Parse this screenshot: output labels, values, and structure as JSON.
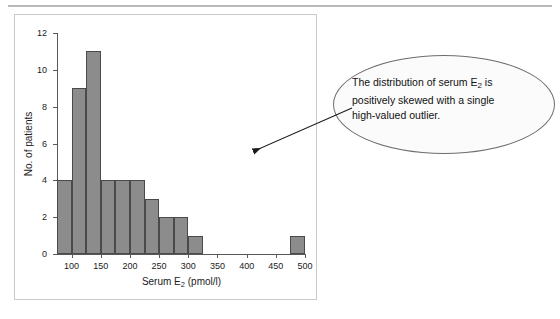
{
  "figure": {
    "annotation": {
      "line1_pre": "The distribution of serum E",
      "line1_sub": "2",
      "line1_post": " is",
      "line2": "positively skewed with a single",
      "line3": "high-valued outlier.",
      "arrow_name": "callout-arrow"
    }
  },
  "chart_data": {
    "type": "bar",
    "title": "",
    "xlabel_pre": "Serum E",
    "xlabel_sub": "2",
    "xlabel_post": " (pmol/l)",
    "xlabel": "Serum E2 (pmol/l)",
    "ylabel": "No. of patients",
    "bin_width": 25,
    "xlim": [
      75,
      500
    ],
    "ylim": [
      0,
      12
    ],
    "grid": false,
    "legend": false,
    "xticks": [
      100,
      150,
      200,
      250,
      300,
      350,
      400,
      450,
      500
    ],
    "yticks": [
      0,
      2,
      4,
      6,
      8,
      10,
      12
    ],
    "bins": [
      {
        "start": 75,
        "end": 100,
        "value": 4
      },
      {
        "start": 100,
        "end": 125,
        "value": 9
      },
      {
        "start": 125,
        "end": 150,
        "value": 11
      },
      {
        "start": 150,
        "end": 175,
        "value": 4
      },
      {
        "start": 175,
        "end": 200,
        "value": 4
      },
      {
        "start": 200,
        "end": 225,
        "value": 4
      },
      {
        "start": 225,
        "end": 250,
        "value": 3
      },
      {
        "start": 250,
        "end": 275,
        "value": 2
      },
      {
        "start": 275,
        "end": 300,
        "value": 2
      },
      {
        "start": 300,
        "end": 325,
        "value": 1
      },
      {
        "start": 475,
        "end": 500,
        "value": 1
      }
    ],
    "categories": [
      "75-100",
      "100-125",
      "125-150",
      "150-175",
      "175-200",
      "200-225",
      "225-250",
      "250-275",
      "275-300",
      "300-325",
      "475-500"
    ],
    "values": [
      4,
      9,
      11,
      4,
      4,
      4,
      3,
      2,
      2,
      1,
      1
    ],
    "colors": {
      "bar_fill": "#8c8c8c",
      "bar_edge": "#4a4a4a",
      "axis": "#58585a"
    }
  }
}
